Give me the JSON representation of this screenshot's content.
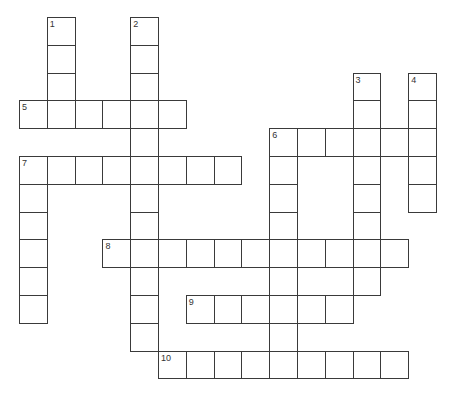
{
  "puzzle": {
    "type": "crossword",
    "grid": {
      "origin_x": 19,
      "origin_y": 17,
      "cell_size": 27.8,
      "line_color": "#3a3a3a",
      "cell_fill": "#ffffff"
    },
    "words": [
      {
        "number": "1",
        "direction": "down",
        "row": 0,
        "col": 1,
        "length": 4
      },
      {
        "number": "2",
        "direction": "down",
        "row": 0,
        "col": 4,
        "length": 12
      },
      {
        "number": "3",
        "direction": "down",
        "row": 2,
        "col": 12,
        "length": 8
      },
      {
        "number": "4",
        "direction": "down",
        "row": 2,
        "col": 14,
        "length": 5
      },
      {
        "number": "5",
        "direction": "across",
        "row": 3,
        "col": 0,
        "length": 6
      },
      {
        "number": "6",
        "direction": "across",
        "row": 4,
        "col": 9,
        "length": 6
      },
      {
        "number": "6",
        "direction": "down",
        "row": 4,
        "col": 9,
        "length": 9
      },
      {
        "number": "7",
        "direction": "across",
        "row": 5,
        "col": 0,
        "length": 8
      },
      {
        "number": "7",
        "direction": "down",
        "row": 5,
        "col": 0,
        "length": 6
      },
      {
        "number": "8",
        "direction": "across",
        "row": 8,
        "col": 3,
        "length": 11
      },
      {
        "number": "9",
        "direction": "across",
        "row": 10,
        "col": 6,
        "length": 6
      },
      {
        "number": "10",
        "direction": "across",
        "row": 12,
        "col": 5,
        "length": 9
      }
    ]
  }
}
